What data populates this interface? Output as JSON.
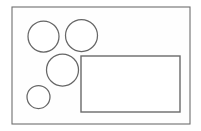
{
  "image": {
    "title": "Geometric shapes line drawing",
    "width": 201,
    "height": 131,
    "background_color": "#ffffff"
  },
  "chart_data": {
    "type": "diagram",
    "units": "pixels",
    "shapes": [
      {
        "id": "outer-frame",
        "kind": "rectangle",
        "label": "Outer frame",
        "x": 12,
        "y": 7,
        "width": 178,
        "height": 117,
        "fill": "#fefefe",
        "stroke": "#6e6e6e",
        "stroke_width": 1.1
      },
      {
        "id": "circle-top-left",
        "kind": "circle",
        "label": "Top-left circle",
        "cx": 43.5,
        "cy": 36.5,
        "r": 15.5,
        "fill": "#ffffff",
        "stroke": "#666666",
        "stroke_width": 1.25
      },
      {
        "id": "circle-top-right",
        "kind": "circle",
        "label": "Top-right circle",
        "cx": 81.5,
        "cy": 35.5,
        "r": 16,
        "fill": "#ffffff",
        "stroke": "#666666",
        "stroke_width": 1.25
      },
      {
        "id": "circle-middle",
        "kind": "circle",
        "label": "Middle circle",
        "cx": 62.5,
        "cy": 70,
        "r": 16,
        "fill": "#ffffff",
        "stroke": "#666666",
        "stroke_width": 1.25
      },
      {
        "id": "circle-bottom-left",
        "kind": "circle",
        "label": "Bottom-left small circle",
        "cx": 38.5,
        "cy": 97,
        "r": 11.5,
        "fill": "#ffffff",
        "stroke": "#666666",
        "stroke_width": 1.25
      },
      {
        "id": "inner-rectangle",
        "kind": "rectangle",
        "label": "Inner rectangle",
        "x": 81,
        "y": 56,
        "width": 99,
        "height": 56,
        "fill": "#ffffff",
        "stroke": "#6a6a6a",
        "stroke_width": 1.4
      }
    ],
    "counts": {
      "circles": 4,
      "rectangles": 2
    }
  }
}
